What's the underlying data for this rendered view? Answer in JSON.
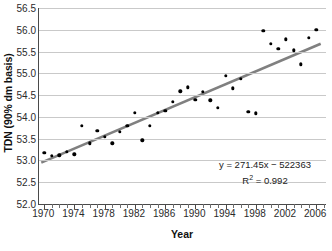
{
  "chart_data": {
    "type": "scatter",
    "title": "",
    "xlabel": "Year",
    "ylabel": "TDN (90% dm basis)",
    "xlim": [
      1969.3,
      2007.3
    ],
    "ylim": [
      52.0,
      56.5
    ],
    "grid": true,
    "legend": "none",
    "x_ticks_major": [
      1970,
      1974,
      1978,
      1982,
      1986,
      1990,
      1994,
      1998,
      2002,
      2006
    ],
    "x_tick_step_minor": 1,
    "y_ticks": [
      52.0,
      52.5,
      53.0,
      53.5,
      54.0,
      54.5,
      55.0,
      55.5,
      56.0,
      56.5
    ],
    "y_tick_labels": [
      "52.0",
      "52.5",
      "53.0",
      "53.5",
      "54.0",
      "54.5",
      "55.0",
      "55.5",
      "56.0",
      "56.5"
    ],
    "x_tick_labels": [
      "1970",
      "1974",
      "1978",
      "1982",
      "1986",
      "1990",
      "1994",
      "1998",
      "2002",
      "2006"
    ],
    "series": [
      {
        "name": "TDN",
        "marker": "dot",
        "color": "#000000",
        "x": [
          1970,
          1971,
          1972,
          1973,
          1974,
          1975,
          1976,
          1977,
          1978,
          1979,
          1980,
          1981,
          1982,
          1983,
          1984,
          1985,
          1986,
          1987,
          1988,
          1989,
          1990,
          1991,
          1992,
          1993,
          1994,
          1995,
          1996,
          1997,
          1998,
          1999,
          2000,
          2001,
          2002,
          2003,
          2004,
          2005,
          2006
        ],
        "y": [
          53.18,
          53.11,
          53.12,
          53.2,
          53.14,
          53.79,
          53.39,
          53.68,
          53.54,
          53.39,
          53.66,
          53.79,
          54.09,
          53.46,
          53.79,
          54.09,
          54.14,
          54.35,
          54.59,
          54.68,
          54.39,
          54.58,
          54.38,
          54.21,
          54.95,
          54.66,
          54.87,
          54.12,
          54.08,
          55.97,
          55.68,
          55.56,
          55.78,
          55.53,
          55.21,
          55.81,
          56.0
        ]
      }
    ],
    "trendline": {
      "equation": "y = 271.45x − 522363",
      "r_squared_label": "R",
      "r_squared_sup": "2",
      "r_squared_value": " = 0.992",
      "slope_per_year": 0.0745,
      "color": "#808080",
      "x_start": 1969.6,
      "y_start": 52.95,
      "x_end": 2006.6,
      "y_end": 55.68
    },
    "colors": {
      "marker": "#000000",
      "trendline": "#808080",
      "gridline": "#c9c9c9",
      "axis": "#4a4a4a",
      "text": "#1a1a1a",
      "background": "#ffffff"
    }
  }
}
